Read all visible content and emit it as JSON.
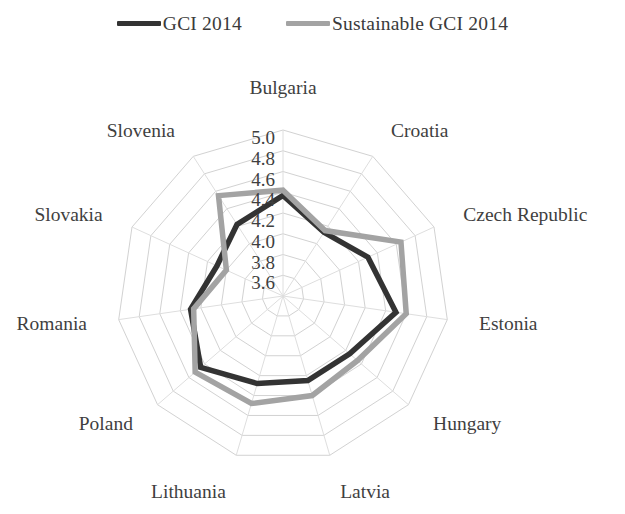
{
  "legend": {
    "position": "top-center",
    "entries": [
      {
        "label": "GCI 2014",
        "color": "#333333",
        "swatch_name": "legend-swatch-gci"
      },
      {
        "label": "Sustainable GCI 2014",
        "color": "#a3a3a3",
        "swatch_name": "legend-swatch-sustainable-gci"
      }
    ]
  },
  "chart_data": {
    "type": "radar",
    "title": "",
    "subtitle": "",
    "xlabel": "",
    "ylabel": "",
    "grid": true,
    "legend_position": "top-center",
    "rlim": [
      3.4,
      5.0
    ],
    "r_ticks": [
      "3.6",
      "3.8",
      "4.0",
      "4.2",
      "4.4",
      "4.6",
      "4.8",
      "5.0"
    ],
    "r_tick_values": [
      3.6,
      3.8,
      4.0,
      4.2,
      4.4,
      4.6,
      4.8,
      5.0
    ],
    "categories": [
      "Bulgaria",
      "Croatia",
      "Czech Republic",
      "Estonia",
      "Hungary",
      "Latvia",
      "Lithuania",
      "Poland",
      "Romania",
      "Slovakia",
      "Slovenia"
    ],
    "series": [
      {
        "name": "GCI 2014",
        "color": "#333333",
        "values": [
          4.37,
          4.13,
          4.3,
          4.5,
          4.25,
          4.25,
          4.28,
          4.45,
          4.3,
          4.1,
          4.22
        ]
      },
      {
        "name": "Sustainable GCI 2014",
        "color": "#a3a3a3",
        "values": [
          4.42,
          4.15,
          4.65,
          4.6,
          4.35,
          4.4,
          4.48,
          4.52,
          4.27,
          4.0,
          4.55
        ]
      }
    ]
  }
}
